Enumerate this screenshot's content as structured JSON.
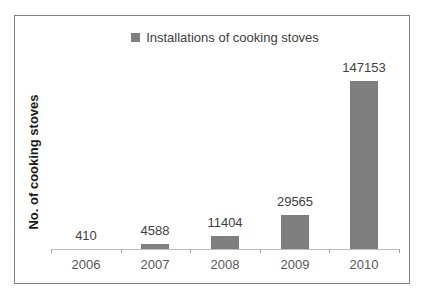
{
  "chart_data": {
    "type": "bar",
    "title": "",
    "categories": [
      "2006",
      "2007",
      "2008",
      "2009",
      "2010"
    ],
    "values": [
      410,
      4588,
      11404,
      29565,
      147153
    ],
    "data_labels": [
      "410",
      "4588",
      "11404",
      "29565",
      "147153"
    ],
    "series_name": "Installations of cooking stoves",
    "xlabel": "",
    "ylabel": "No. of cooking stoves",
    "ylim": [
      0,
      160000
    ],
    "grid": false,
    "legend_position": "top-center",
    "colors": {
      "bar": "#7f7f7f",
      "legend_marker": "#7f7f7f",
      "axis_line": "#bfbfbf",
      "tick_mark": "#a6a6a6",
      "data_label_text": "#3f3f3f",
      "category_label_text": "#595959",
      "axis_title_text": "#1a1a1a",
      "frame_border": "#808080",
      "background": "#ffffff"
    }
  }
}
